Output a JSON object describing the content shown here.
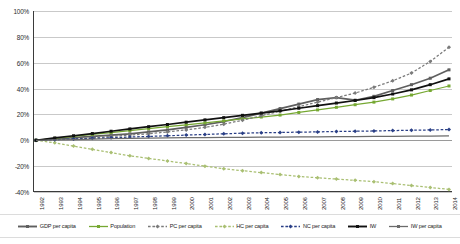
{
  "chart_data": {
    "type": "line",
    "title": "",
    "xlabel": "",
    "ylabel": "",
    "ylim": [
      -40,
      100
    ],
    "ytick_labels": [
      "100%",
      "80%",
      "60%",
      "40%",
      "20%",
      "0%",
      "-20%",
      "-40%"
    ],
    "ytick_values": [
      100,
      80,
      60,
      40,
      20,
      0,
      -20,
      -40
    ],
    "grid": true,
    "legend_position": "bottom",
    "x": [
      1992,
      1993,
      1994,
      1995,
      1996,
      1997,
      1998,
      1999,
      2000,
      2001,
      2002,
      2003,
      2004,
      2005,
      2006,
      2007,
      2008,
      2009,
      2010,
      2011,
      2012,
      2013,
      2014
    ],
    "categories": [
      "1992",
      "1993",
      "1994",
      "1995",
      "1996",
      "1997",
      "1998",
      "1999",
      "2000",
      "2001",
      "2002",
      "2003",
      "2004",
      "2005",
      "2006",
      "2007",
      "2008",
      "2009",
      "2010",
      "2011",
      "2012",
      "2013",
      "2014"
    ],
    "series": [
      {
        "name": "GDP per capita",
        "color": "#5f5f5f",
        "style": "solid",
        "marker": "square",
        "values": [
          0,
          1,
          2,
          3,
          4,
          5,
          6.5,
          8,
          10,
          12,
          14.5,
          17.5,
          21,
          24.5,
          28,
          31.5,
          33,
          31,
          34,
          38.5,
          43,
          48,
          54.5
        ]
      },
      {
        "name": "Population",
        "color": "#76a832",
        "style": "solid",
        "marker": "square",
        "values": [
          0,
          1.5,
          3,
          4.5,
          6,
          7.5,
          9,
          10.5,
          12,
          13.5,
          15,
          16.5,
          18,
          19.5,
          21.5,
          23.5,
          25.5,
          27.5,
          29.5,
          32,
          35,
          38.5,
          42
        ]
      },
      {
        "name": "PC per capita",
        "color": "#7a7a7a",
        "style": "dashed",
        "marker": "diamond",
        "values": [
          0,
          0.5,
          1,
          2,
          3,
          4,
          5,
          6.5,
          8,
          10,
          12.5,
          15.5,
          19,
          22.5,
          26,
          29.5,
          33,
          36.5,
          41,
          46,
          52,
          61,
          72
        ]
      },
      {
        "name": "HC per capita",
        "color": "#a9bf72",
        "style": "dashed",
        "marker": "diamond",
        "values": [
          0,
          -2,
          -4.5,
          -7,
          -9.5,
          -12,
          -14,
          -16,
          -18,
          -20,
          -22,
          -23.5,
          -25,
          -26.5,
          -28,
          -29,
          -30,
          -31,
          -32,
          -33.5,
          -35,
          -36.5,
          -38
        ]
      },
      {
        "name": "NC per capita",
        "color": "#2a3f86",
        "style": "dashed",
        "marker": "diamond",
        "values": [
          0,
          0.5,
          1,
          1.5,
          2,
          2.5,
          3,
          3.5,
          4,
          4.5,
          5,
          5.5,
          5.8,
          6,
          6.3,
          6.5,
          6.8,
          7,
          7.2,
          7.5,
          7.8,
          8,
          8.3
        ]
      },
      {
        "name": "IW",
        "color": "#111111",
        "style": "solid",
        "marker": "square",
        "values": [
          0,
          1.8,
          3.5,
          5.2,
          7,
          8.8,
          10.5,
          12.2,
          14,
          15.8,
          17.5,
          19.3,
          21,
          22.8,
          24.8,
          26.8,
          28.8,
          30.8,
          33,
          35.8,
          39,
          43,
          47.5
        ]
      },
      {
        "name": "IW per capita",
        "color": "#6b6b6b",
        "style": "solid",
        "marker": "none",
        "values": [
          0,
          0.3,
          0.6,
          0.9,
          1.2,
          1.4,
          1.6,
          1.8,
          2,
          2.1,
          2.2,
          2.3,
          2.4,
          2.5,
          2.6,
          2.7,
          2.8,
          2.9,
          3,
          3.1,
          3.2,
          3.3,
          3.4
        ]
      }
    ]
  },
  "legend": {
    "items": [
      {
        "label": "GDP per capita"
      },
      {
        "label": "Population"
      },
      {
        "label": "PC per capita"
      },
      {
        "label": "HC per capita"
      },
      {
        "label": "NC per capita"
      },
      {
        "label": "IW"
      },
      {
        "label": "IW per capita"
      }
    ]
  }
}
